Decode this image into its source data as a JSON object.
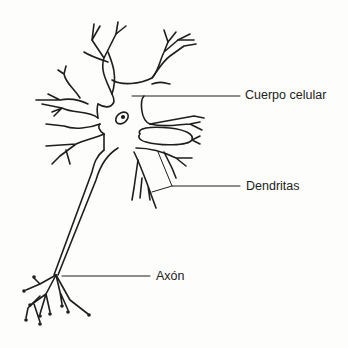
{
  "diagram": {
    "labels": {
      "cell_body": "Cuerpo celular",
      "dendrites": "Dendritas",
      "axon": "Axón"
    },
    "colors": {
      "ink": "#1e1e1e",
      "background": "#fdfdfb"
    }
  }
}
